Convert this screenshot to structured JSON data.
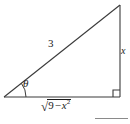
{
  "figure": {
    "name": "right-triangle-trig-substitution",
    "stroke_color": "#3a3a3a",
    "text_color": "#1a1a1a",
    "background_color": "#ffffff",
    "rule_color": "#8a8a8a",
    "vertices": {
      "left": [
        4,
        97
      ],
      "bottom_right": [
        120,
        97
      ],
      "top_right": [
        120,
        5
      ]
    },
    "right_angle_marker": {
      "at": "bottom-right",
      "size": 7
    },
    "angle_arc": {
      "at": "left",
      "radius": 22,
      "label": "θ"
    },
    "labels": {
      "hypotenuse": "3",
      "angle": "θ",
      "opposite": "x",
      "adjacent_sqrt_sign": "√",
      "adjacent_radicand_number": "9",
      "adjacent_radicand_operator": "−",
      "adjacent_radicand_variable": "x",
      "adjacent_radicand_exponent": "2",
      "adjacent_full": "√(9 − x²)"
    }
  }
}
